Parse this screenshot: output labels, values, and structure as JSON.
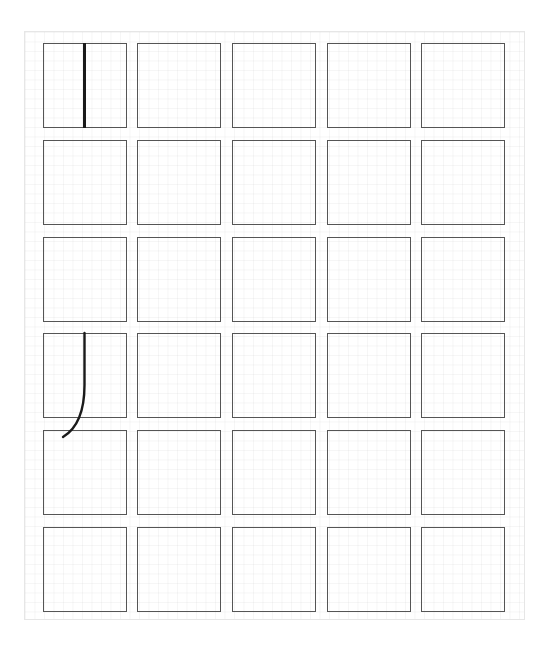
{
  "worksheet": {
    "rows": 6,
    "columns": 5,
    "column_x": [
      43,
      137,
      232,
      327,
      421
    ],
    "row_y": [
      43,
      140,
      237,
      333,
      430,
      527
    ],
    "cell_width": 84,
    "cell_height": 85,
    "border_color": "#555555",
    "grid_color": "#f2f2f2",
    "ink_color": "#1a1a1a"
  },
  "strokes": [
    {
      "name": "vertical-stroke",
      "cell": [
        0,
        0
      ],
      "type": "vertical-line"
    },
    {
      "name": "hook-stroke",
      "cell": [
        3,
        0
      ],
      "type": "vertical-with-left-hook"
    }
  ]
}
